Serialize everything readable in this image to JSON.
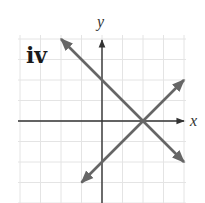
{
  "chart_data": {
    "type": "line",
    "title": "",
    "panel_label": "iv",
    "xlabel": "x",
    "ylabel": "y",
    "xlim": [
      -4,
      4
    ],
    "ylim": [
      -3,
      4
    ],
    "grid": true,
    "series": [
      {
        "name": "decreasing line",
        "equation": "y = -x + 2",
        "x": [
          -2,
          4
        ],
        "y": [
          4,
          -2
        ],
        "color": "#666666"
      },
      {
        "name": "increasing line",
        "equation": "y = x - 2",
        "x": [
          -1,
          4
        ],
        "y": [
          -3,
          2
        ],
        "color": "#666666"
      }
    ],
    "intersection": [
      2,
      0
    ]
  }
}
